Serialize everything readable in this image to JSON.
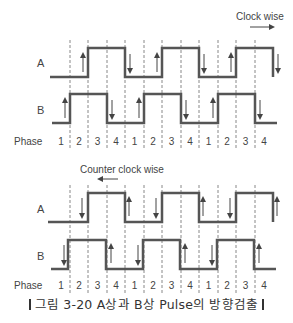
{
  "diagram": {
    "type": "quadrature-encoder-timing",
    "dashed_lines_x": [
      70,
      88,
      107,
      125,
      144,
      162,
      181,
      199,
      218,
      236,
      255
    ],
    "colors": {
      "wave": "#555555",
      "dash": "#888888",
      "arrow": "#444444",
      "text": "#444444"
    },
    "top": {
      "direction_label": "Clock wise",
      "direction_arrow": "right",
      "signal_a_label": "A",
      "signal_b_label": "B",
      "phase_label": "Phase",
      "phases": [
        "1",
        "2",
        "3",
        "4",
        "1",
        "2",
        "3",
        "4",
        "1",
        "2",
        "3",
        "4"
      ]
    },
    "bottom": {
      "direction_label": "Counter clock wise",
      "direction_arrow": "left",
      "signal_a_label": "A",
      "signal_b_label": "B",
      "phase_label": "Phase",
      "phases": [
        "1",
        "2",
        "3",
        "4",
        "1",
        "2",
        "3",
        "4",
        "1",
        "2",
        "3",
        "4"
      ]
    }
  },
  "caption": "그림 3-20 A상과 B상 Pulse의 방향검출"
}
